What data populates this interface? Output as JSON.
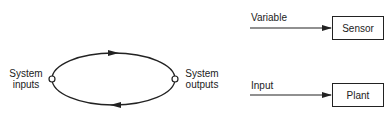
{
  "loop_diagram": {
    "input_label_line1": "System",
    "input_label_line2": "inputs",
    "output_label_line1": "System",
    "output_label_line2": "outputs"
  },
  "block_diagram": {
    "sensor": {
      "input_label": "Variable",
      "box_label": "Sensor"
    },
    "plant": {
      "input_label": "Input",
      "box_label": "Plant"
    }
  },
  "colors": {
    "stroke": "#222222",
    "background": "#ffffff"
  }
}
